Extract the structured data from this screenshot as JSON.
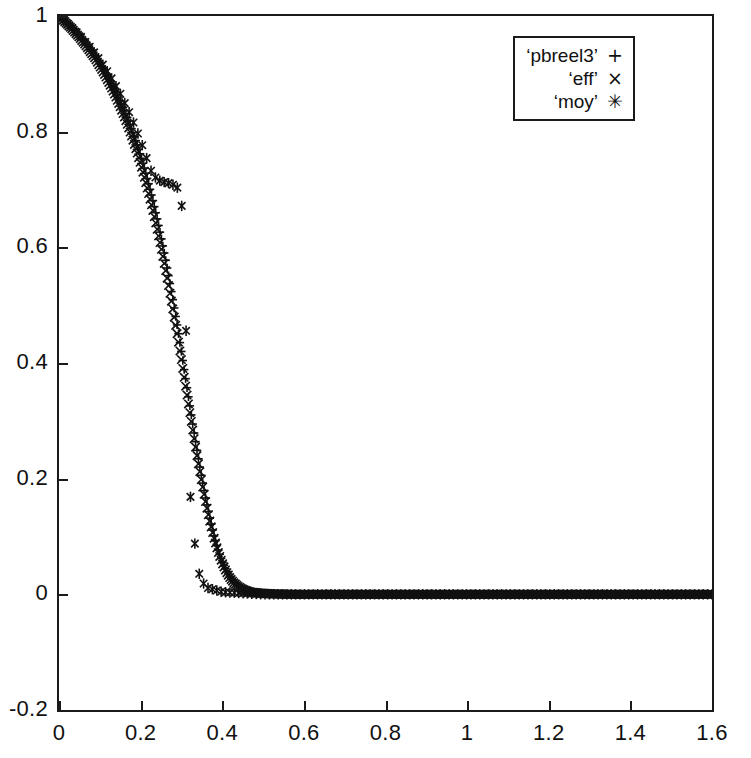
{
  "chart_data": {
    "type": "scatter",
    "title": "",
    "xlabel": "",
    "ylabel": "",
    "xlim": [
      0,
      1.6
    ],
    "ylim": [
      -0.2,
      1.0
    ],
    "grid": false,
    "legend_position": "top-right",
    "xticks": [
      "0",
      "0.2",
      "0.4",
      "0.6",
      "0.8",
      "1",
      "1.2",
      "1.4",
      "1.6"
    ],
    "xtick_values": [
      0,
      0.2,
      0.4,
      0.6,
      0.8,
      1,
      1.2,
      1.4,
      1.6
    ],
    "yticks": [
      "1",
      "0.8",
      "0.6",
      "0.4",
      "0.2",
      "0",
      "-0.2"
    ],
    "ytick_values": [
      1,
      0.8,
      0.6,
      0.4,
      0.2,
      0,
      -0.2
    ],
    "series": [
      {
        "name": "'pbreel3'",
        "marker": "+",
        "marker_glyph": "+",
        "color": "#111111",
        "x": [
          0,
          0.01,
          0.02,
          0.03,
          0.04,
          0.05,
          0.06,
          0.07,
          0.08,
          0.09,
          0.1,
          0.11,
          0.12,
          0.13,
          0.14,
          0.15,
          0.16,
          0.17,
          0.18,
          0.19,
          0.2,
          0.21,
          0.22,
          0.23,
          0.24,
          0.25,
          0.26,
          0.27,
          0.28,
          0.29,
          0.3,
          0.31,
          0.32,
          0.33,
          0.34,
          0.35,
          0.36,
          0.37,
          0.38,
          0.39,
          0.4,
          0.41,
          0.42,
          0.43,
          0.44,
          0.45,
          0.46,
          0.47,
          0.48,
          0.5,
          0.52,
          0.55,
          0.6,
          0.7,
          0.8,
          0.9,
          1.0,
          1.1,
          1.2,
          1.3,
          1.4,
          1.5,
          1.6
        ],
        "y": [
          1.0,
          0.994,
          0.988,
          0.981,
          0.974,
          0.966,
          0.958,
          0.949,
          0.94,
          0.93,
          0.919,
          0.907,
          0.895,
          0.882,
          0.868,
          0.853,
          0.837,
          0.82,
          0.801,
          0.781,
          0.759,
          0.735,
          0.709,
          0.681,
          0.651,
          0.618,
          0.583,
          0.545,
          0.505,
          0.463,
          0.419,
          0.374,
          0.329,
          0.284,
          0.241,
          0.2,
          0.163,
          0.13,
          0.101,
          0.077,
          0.057,
          0.041,
          0.029,
          0.021,
          0.014,
          0.01,
          0.007,
          0.005,
          0.003,
          0.002,
          0.001,
          0.001,
          0.0,
          0.0,
          0.0,
          0.0,
          0.0,
          0.0,
          0.0,
          0.0,
          0.0,
          0.0,
          0.0
        ]
      },
      {
        "name": "'eff'",
        "marker": "x",
        "marker_glyph": "×",
        "color": "#111111",
        "x": [
          0,
          0.01,
          0.02,
          0.03,
          0.04,
          0.05,
          0.06,
          0.07,
          0.08,
          0.09,
          0.1,
          0.11,
          0.12,
          0.13,
          0.14,
          0.15,
          0.16,
          0.17,
          0.18,
          0.19,
          0.2,
          0.21,
          0.22,
          0.23,
          0.24,
          0.25,
          0.26,
          0.27,
          0.28,
          0.29,
          0.3,
          0.31,
          0.32,
          0.33,
          0.34,
          0.35,
          0.36,
          0.37,
          0.38,
          0.39,
          0.4,
          0.41,
          0.42,
          0.43,
          0.44,
          0.45,
          0.46,
          0.47,
          0.48,
          0.5,
          0.52,
          0.55,
          0.6,
          0.7,
          0.8,
          0.9,
          1.0,
          1.1,
          1.2,
          1.3,
          1.4,
          1.5,
          1.6
        ],
        "y": [
          1.0,
          0.993,
          0.986,
          0.979,
          0.971,
          0.963,
          0.954,
          0.945,
          0.935,
          0.925,
          0.913,
          0.901,
          0.888,
          0.874,
          0.859,
          0.843,
          0.826,
          0.808,
          0.788,
          0.767,
          0.744,
          0.719,
          0.692,
          0.664,
          0.633,
          0.6,
          0.565,
          0.528,
          0.489,
          0.448,
          0.405,
          0.361,
          0.317,
          0.274,
          0.232,
          0.193,
          0.157,
          0.125,
          0.097,
          0.073,
          0.054,
          0.039,
          0.027,
          0.019,
          0.013,
          0.009,
          0.006,
          0.004,
          0.003,
          0.002,
          0.001,
          0.0,
          0.0,
          0.0,
          0.0,
          0.0,
          0.0,
          0.0,
          0.0,
          0.0,
          0.0,
          0.0,
          0.0
        ]
      },
      {
        "name": "'moy'",
        "marker": "*",
        "marker_glyph": "✳",
        "color": "#111111",
        "x": [
          0,
          0.012,
          0.025,
          0.037,
          0.05,
          0.062,
          0.075,
          0.087,
          0.1,
          0.112,
          0.125,
          0.137,
          0.15,
          0.162,
          0.175,
          0.187,
          0.2,
          0.212,
          0.225,
          0.237,
          0.25,
          0.262,
          0.275,
          0.287,
          0.295,
          0.3,
          0.302,
          0.304,
          0.306,
          0.308,
          0.31,
          0.311,
          0.312,
          0.313,
          0.314,
          0.315,
          0.316,
          0.317,
          0.318,
          0.32,
          0.322,
          0.325,
          0.33,
          0.335,
          0.34,
          0.345,
          0.36,
          0.4,
          0.5,
          0.6,
          0.8,
          1.0,
          1.2,
          1.4,
          1.6
        ],
        "y": [
          1.0,
          0.992,
          0.984,
          0.976,
          0.967,
          0.957,
          0.947,
          0.936,
          0.924,
          0.911,
          0.897,
          0.882,
          0.866,
          0.848,
          0.829,
          0.808,
          0.785,
          0.76,
          0.733,
          0.72,
          0.714,
          0.712,
          0.71,
          0.705,
          0.7,
          0.68,
          0.655,
          0.625,
          0.59,
          0.555,
          0.515,
          0.47,
          0.435,
          0.42,
          0.38,
          0.345,
          0.3,
          0.265,
          0.23,
          0.2,
          0.17,
          0.14,
          0.105,
          0.075,
          0.05,
          0.03,
          0.012,
          0.004,
          0.0,
          0.0,
          0.0,
          0.0,
          0.0,
          0.0,
          0.0
        ]
      }
    ]
  },
  "legend": {
    "entries": [
      {
        "label": "‘pbreel3’",
        "marker": "+"
      },
      {
        "label": "‘eff’",
        "marker": "×"
      },
      {
        "label": "‘moy’",
        "marker": "✳"
      }
    ]
  },
  "axes": {
    "x_tick_labels": [
      "0",
      "0.2",
      "0.4",
      "0.6",
      "0.8",
      "1",
      "1.2",
      "1.4",
      "1.6"
    ],
    "y_tick_labels": [
      "1",
      "0.8",
      "0.6",
      "0.4",
      "0.2",
      "0",
      "-0.2"
    ]
  },
  "style": {
    "ink": "#111111",
    "frame": "#1a1a1a",
    "background": "#ffffff"
  }
}
